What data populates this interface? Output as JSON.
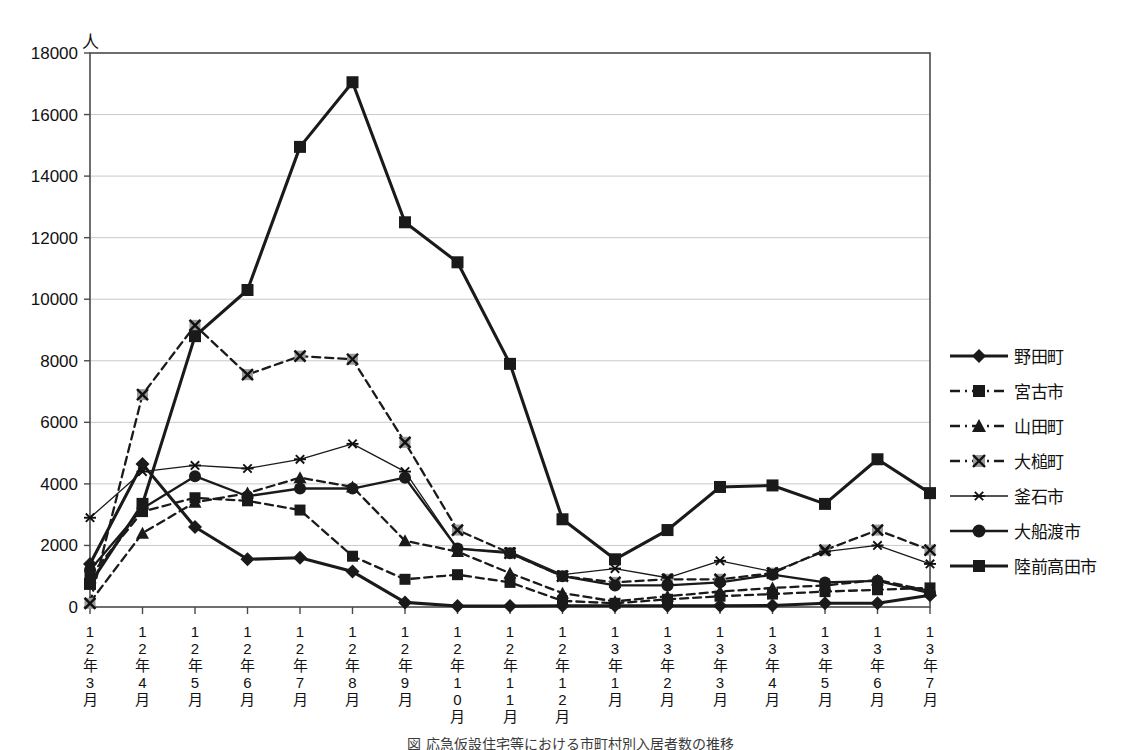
{
  "chart_data": {
    "type": "line",
    "title": "",
    "unit_label": "人",
    "xlabel": "",
    "ylabel": "",
    "ylim": [
      0,
      18000
    ],
    "ytick_step": 2000,
    "yticks": [
      "0",
      "2000",
      "4000",
      "6000",
      "8000",
      "10000",
      "12000",
      "14000",
      "16000",
      "18000"
    ],
    "grid": true,
    "legend_position": "right",
    "categories": [
      "12年3月",
      "12年4月",
      "12年5月",
      "12年6月",
      "12年7月",
      "12年8月",
      "12年9月",
      "12年10月",
      "12年11月",
      "12年12月",
      "13年1月",
      "13年2月",
      "13年3月",
      "13年4月",
      "13年5月",
      "13年6月",
      "13年7月"
    ],
    "category_lines": [
      [
        "1",
        "2",
        "年",
        "3",
        "月"
      ],
      [
        "1",
        "2",
        "年",
        "4",
        "月"
      ],
      [
        "1",
        "2",
        "年",
        "5",
        "月"
      ],
      [
        "1",
        "2",
        "年",
        "6",
        "月"
      ],
      [
        "1",
        "2",
        "年",
        "7",
        "月"
      ],
      [
        "1",
        "2",
        "年",
        "8",
        "月"
      ],
      [
        "1",
        "2",
        "年",
        "9",
        "月"
      ],
      [
        "1",
        "2",
        "年",
        "1",
        "0",
        "月"
      ],
      [
        "1",
        "2",
        "年",
        "1",
        "1",
        "月"
      ],
      [
        "1",
        "2",
        "年",
        "1",
        "2",
        "月"
      ],
      [
        "1",
        "3",
        "年",
        "1",
        "月"
      ],
      [
        "1",
        "3",
        "年",
        "2",
        "月"
      ],
      [
        "1",
        "3",
        "年",
        "3",
        "月"
      ],
      [
        "1",
        "3",
        "年",
        "4",
        "月"
      ],
      [
        "1",
        "3",
        "年",
        "5",
        "月"
      ],
      [
        "1",
        "3",
        "年",
        "6",
        "月"
      ],
      [
        "1",
        "3",
        "年",
        "7",
        "月"
      ]
    ],
    "series": [
      {
        "name": "野田町",
        "marker": "diamond",
        "dash": "solid",
        "width": "thick",
        "values": [
          1400,
          4650,
          2600,
          1550,
          1600,
          1150,
          150,
          30,
          30,
          40,
          40,
          40,
          40,
          50,
          120,
          120,
          380
        ]
      },
      {
        "name": "宮古市",
        "marker": "square",
        "dash": "dashed",
        "width": "medium",
        "values": [
          1000,
          3100,
          3550,
          3450,
          3150,
          1650,
          900,
          1050,
          800,
          200,
          120,
          250,
          350,
          420,
          500,
          560,
          620
        ]
      },
      {
        "name": "山田町",
        "marker": "triangle",
        "dash": "dashed",
        "width": "medium",
        "values": [
          150,
          2400,
          3400,
          3700,
          4200,
          3900,
          2150,
          1800,
          1100,
          450,
          180,
          350,
          500,
          620,
          700,
          880,
          520
        ]
      },
      {
        "name": "大槌町",
        "marker": "x",
        "dash": "dashed",
        "width": "medium",
        "values": [
          120,
          6900,
          9150,
          7550,
          8150,
          8050,
          5350,
          2500,
          1750,
          1000,
          800,
          900,
          900,
          1100,
          1850,
          2500,
          1850
        ]
      },
      {
        "name": "釜石市",
        "marker": "asterisk",
        "dash": "solid",
        "width": "thin",
        "values": [
          2900,
          4400,
          4600,
          4500,
          4800,
          5300,
          4400,
          1900,
          1800,
          1050,
          1250,
          950,
          1500,
          1150,
          1800,
          2000,
          1400
        ]
      },
      {
        "name": "大船渡市",
        "marker": "circle",
        "dash": "solid",
        "width": "medium",
        "values": [
          1200,
          3200,
          4250,
          3600,
          3850,
          3850,
          4200,
          1900,
          1750,
          1000,
          700,
          700,
          800,
          1050,
          800,
          850,
          450
        ]
      },
      {
        "name": "陸前高田市",
        "marker": "square",
        "dash": "solid",
        "width": "thick",
        "values": [
          750,
          3350,
          8800,
          10300,
          14950,
          17050,
          12500,
          11200,
          7900,
          2850,
          1550,
          2500,
          3900,
          3950,
          3350,
          4800,
          3700
        ]
      }
    ]
  },
  "caption": {
    "text": "図 応急仮設住宅等における市町村別入居者数の推移"
  }
}
